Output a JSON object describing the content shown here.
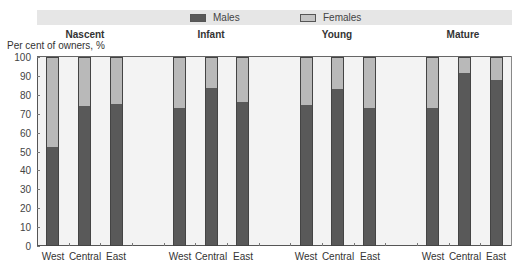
{
  "chart_data": {
    "type": "bar",
    "stacked": true,
    "title": "",
    "xlabel": "",
    "ylabel": "Per cent of owners, %",
    "ylim": [
      0,
      100
    ],
    "yticks": [
      0,
      10,
      20,
      30,
      40,
      50,
      60,
      70,
      80,
      90,
      100
    ],
    "legend": {
      "position": "top",
      "entries": [
        "Males",
        "Females"
      ]
    },
    "colors": {
      "Males": "#595959",
      "Females": "#b9b9b9"
    },
    "groups": [
      "Nascent",
      "Infant",
      "Young",
      "Mature"
    ],
    "categories": [
      "West",
      "Central",
      "East"
    ],
    "series": [
      {
        "name": "Males",
        "values": {
          "Nascent": [
            52,
            73.5,
            74.5
          ],
          "Infant": [
            72.5,
            83,
            75.5
          ],
          "Young": [
            74,
            82.5,
            72.5
          ],
          "Mature": [
            72.5,
            91,
            87.5
          ]
        }
      },
      {
        "name": "Females",
        "values": {
          "Nascent": [
            48,
            26.5,
            25.5
          ],
          "Infant": [
            27.5,
            17,
            24.5
          ],
          "Young": [
            26,
            17.5,
            27.5
          ],
          "Mature": [
            27.5,
            9,
            12.5
          ]
        }
      }
    ]
  },
  "legend": {
    "males": "Males",
    "females": "Females"
  },
  "axis": {
    "y_title": "Per cent of owners, %"
  },
  "groups": [
    {
      "label": "Nascent"
    },
    {
      "label": "Infant"
    },
    {
      "label": "Young"
    },
    {
      "label": "Mature"
    }
  ]
}
